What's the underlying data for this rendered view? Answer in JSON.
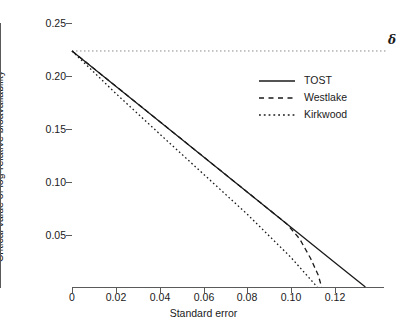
{
  "chart_data": {
    "type": "line",
    "title": "",
    "xlabel": "Standard error",
    "ylabel": "Critical value of log-relative bioavailability",
    "xlim": [
      0,
      0.1425
    ],
    "ylim": [
      0,
      0.25
    ],
    "xticks": [
      0,
      0.02,
      0.04,
      0.06,
      0.08,
      0.1,
      0.12
    ],
    "xticklabels": [
      "0",
      "0.02",
      "0.04",
      "0.06",
      "0.08",
      "0.10",
      "0.12"
    ],
    "yticks": [
      0.05,
      0.1,
      0.15,
      0.2,
      0.25
    ],
    "yticklabels": [
      "0.05",
      "0.10",
      "0.15",
      "0.20",
      "0.25"
    ],
    "grid": false,
    "legend_position": "upper right",
    "series": [
      {
        "name": "TOST",
        "style": "solid",
        "color": "#1a1a1a",
        "x": [
          0,
          0.02,
          0.04,
          0.06,
          0.08,
          0.1,
          0.12,
          0.134
        ],
        "y": [
          0.2235,
          0.1902,
          0.1568,
          0.1234,
          0.09,
          0.0566,
          0.0232,
          0.0
        ]
      },
      {
        "name": "Westlake",
        "style": "dashed",
        "color": "#1a1a1a",
        "x": [
          0,
          0.02,
          0.04,
          0.06,
          0.08,
          0.09,
          0.098,
          0.104,
          0.109,
          0.1125,
          0.114
        ],
        "y": [
          0.2235,
          0.1902,
          0.1568,
          0.1234,
          0.09,
          0.0733,
          0.06,
          0.0455,
          0.027,
          0.011,
          0.0
        ]
      },
      {
        "name": "Kirkwood",
        "style": "dotted",
        "color": "#1a1a1a",
        "x": [
          0,
          0.02,
          0.04,
          0.06,
          0.08,
          0.1,
          0.112
        ],
        "y": [
          0.2235,
          0.1833,
          0.145,
          0.107,
          0.069,
          0.028,
          0.0
        ]
      }
    ],
    "reference_lines": [
      {
        "name": "delta",
        "orientation": "horizontal",
        "value": 0.2235,
        "style": "dotted",
        "color": "#8a8a8a",
        "label": "δ"
      }
    ]
  },
  "legend": {
    "entries": [
      {
        "label": "TOST"
      },
      {
        "label": "Westlake"
      },
      {
        "label": "Kirkwood"
      }
    ]
  }
}
